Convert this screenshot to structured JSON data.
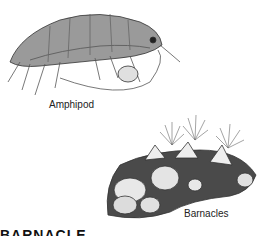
{
  "figures": [
    {
      "id": "amphipod",
      "label": "Amphipod"
    },
    {
      "id": "barnacles",
      "label": "Barnacles"
    }
  ],
  "heading": "BARNACLE",
  "colors": {
    "ink": "#222222",
    "shade": "#8a8a8a",
    "light": "#d6d6d6",
    "background": "#ffffff"
  }
}
